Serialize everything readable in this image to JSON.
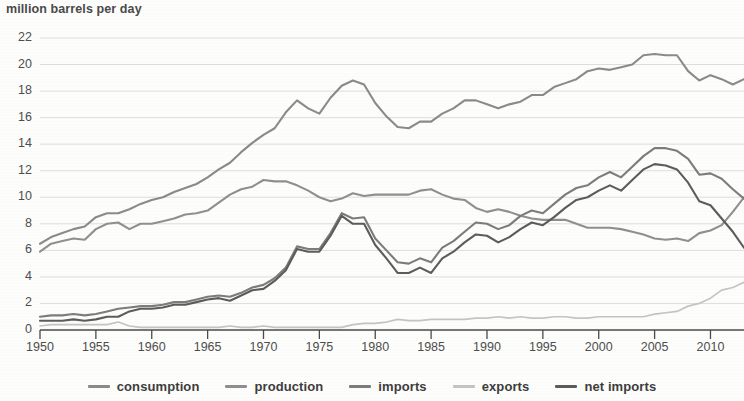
{
  "chart_data": {
    "type": "line",
    "title": "million barrels per day",
    "xlabel": "",
    "ylabel": "million barrels per day",
    "xlim": [
      1950,
      2013
    ],
    "ylim": [
      0,
      22
    ],
    "ytick_step": 2,
    "xtick_step": 5,
    "grid": true,
    "legend_position": "bottom",
    "ytick_labels": [
      "0",
      "2",
      "4",
      "6",
      "8",
      "10",
      "12",
      "14",
      "16",
      "18",
      "20",
      "22"
    ],
    "xtick_labels": [
      "1950",
      "1955",
      "1960",
      "1965",
      "1970",
      "1975",
      "1980",
      "1985",
      "1990",
      "1995",
      "2000",
      "2005",
      "2010"
    ],
    "x": [
      1950,
      1951,
      1952,
      1953,
      1954,
      1955,
      1956,
      1957,
      1958,
      1959,
      1960,
      1961,
      1962,
      1963,
      1964,
      1965,
      1966,
      1967,
      1968,
      1969,
      1970,
      1971,
      1972,
      1973,
      1974,
      1975,
      1976,
      1977,
      1978,
      1979,
      1980,
      1981,
      1982,
      1983,
      1984,
      1985,
      1986,
      1987,
      1988,
      1989,
      1990,
      1991,
      1992,
      1993,
      1994,
      1995,
      1996,
      1997,
      1998,
      1999,
      2000,
      2001,
      2002,
      2003,
      2004,
      2005,
      2006,
      2007,
      2008,
      2009,
      2010,
      2011,
      2012,
      2013
    ],
    "series": [
      {
        "name": "consumption",
        "color": "#8a8a8a",
        "values": [
          6.5,
          7.0,
          7.3,
          7.6,
          7.8,
          8.5,
          8.8,
          8.8,
          9.1,
          9.5,
          9.8,
          10.0,
          10.4,
          10.7,
          11.0,
          11.5,
          12.1,
          12.6,
          13.4,
          14.1,
          14.7,
          15.2,
          16.4,
          17.3,
          16.7,
          16.3,
          17.5,
          18.4,
          18.8,
          18.5,
          17.1,
          16.1,
          15.3,
          15.2,
          15.7,
          15.7,
          16.3,
          16.7,
          17.3,
          17.3,
          17.0,
          16.7,
          17.0,
          17.2,
          17.7,
          17.7,
          18.3,
          18.6,
          18.9,
          19.5,
          19.7,
          19.6,
          19.8,
          20.0,
          20.7,
          20.8,
          20.7,
          20.7,
          19.5,
          18.8,
          19.2,
          18.9,
          18.5,
          18.9
        ]
      },
      {
        "name": "production",
        "color": "#8f8f8f",
        "values": [
          5.9,
          6.5,
          6.7,
          6.9,
          6.8,
          7.6,
          8.0,
          8.1,
          7.6,
          8.0,
          8.0,
          8.2,
          8.4,
          8.7,
          8.8,
          9.0,
          9.6,
          10.2,
          10.6,
          10.8,
          11.3,
          11.2,
          11.2,
          10.9,
          10.5,
          10.0,
          9.7,
          9.9,
          10.3,
          10.1,
          10.2,
          10.2,
          10.2,
          10.2,
          10.5,
          10.6,
          10.2,
          9.9,
          9.8,
          9.2,
          8.9,
          9.1,
          8.9,
          8.6,
          8.4,
          8.3,
          8.3,
          8.3,
          8.0,
          7.7,
          7.7,
          7.7,
          7.6,
          7.4,
          7.2,
          6.9,
          6.8,
          6.9,
          6.7,
          7.3,
          7.5,
          7.9,
          8.9,
          10.0
        ]
      },
      {
        "name": "imports",
        "color": "#7c7c7c",
        "values": [
          1.0,
          1.1,
          1.1,
          1.2,
          1.1,
          1.2,
          1.4,
          1.6,
          1.7,
          1.8,
          1.8,
          1.9,
          2.1,
          2.1,
          2.3,
          2.5,
          2.6,
          2.5,
          2.8,
          3.2,
          3.4,
          3.9,
          4.7,
          6.3,
          6.1,
          6.1,
          7.3,
          8.8,
          8.4,
          8.5,
          6.9,
          6.0,
          5.1,
          5.0,
          5.4,
          5.1,
          6.2,
          6.7,
          7.4,
          8.1,
          8.0,
          7.6,
          7.9,
          8.6,
          9.0,
          8.8,
          9.5,
          10.2,
          10.7,
          10.9,
          11.5,
          11.9,
          11.5,
          12.3,
          13.1,
          13.7,
          13.7,
          13.5,
          12.9,
          11.7,
          11.8,
          11.4,
          10.6,
          9.9
        ]
      },
      {
        "name": "exports",
        "color": "#c4c4c4",
        "values": [
          0.3,
          0.4,
          0.4,
          0.4,
          0.4,
          0.4,
          0.4,
          0.6,
          0.3,
          0.2,
          0.2,
          0.2,
          0.2,
          0.2,
          0.2,
          0.2,
          0.2,
          0.3,
          0.2,
          0.2,
          0.3,
          0.2,
          0.2,
          0.2,
          0.2,
          0.2,
          0.2,
          0.2,
          0.4,
          0.5,
          0.5,
          0.6,
          0.8,
          0.7,
          0.7,
          0.8,
          0.8,
          0.8,
          0.8,
          0.9,
          0.9,
          1.0,
          0.9,
          1.0,
          0.9,
          0.9,
          1.0,
          1.0,
          0.9,
          0.9,
          1.0,
          1.0,
          1.0,
          1.0,
          1.0,
          1.2,
          1.3,
          1.4,
          1.8,
          2.0,
          2.4,
          3.0,
          3.2,
          3.6
        ]
      },
      {
        "name": "net imports",
        "color": "#5c5c5c",
        "values": [
          0.7,
          0.7,
          0.7,
          0.8,
          0.7,
          0.8,
          1.0,
          1.0,
          1.4,
          1.6,
          1.6,
          1.7,
          1.9,
          1.9,
          2.1,
          2.3,
          2.4,
          2.2,
          2.6,
          3.0,
          3.1,
          3.7,
          4.5,
          6.1,
          5.9,
          5.9,
          7.1,
          8.6,
          8.0,
          8.0,
          6.4,
          5.4,
          4.3,
          4.3,
          4.7,
          4.3,
          5.4,
          5.9,
          6.6,
          7.2,
          7.1,
          6.6,
          7.0,
          7.6,
          8.1,
          7.9,
          8.5,
          9.2,
          9.8,
          10.0,
          10.5,
          10.9,
          10.5,
          11.3,
          12.1,
          12.5,
          12.4,
          12.1,
          11.1,
          9.7,
          9.4,
          8.4,
          7.4,
          6.2
        ]
      }
    ]
  },
  "legend": {
    "items": [
      {
        "label": "consumption",
        "color": "#8a8a8a"
      },
      {
        "label": "production",
        "color": "#8f8f8f"
      },
      {
        "label": "imports",
        "color": "#7c7c7c"
      },
      {
        "label": "exports",
        "color": "#c4c4c4"
      },
      {
        "label": "net imports",
        "color": "#5c5c5c"
      }
    ]
  }
}
